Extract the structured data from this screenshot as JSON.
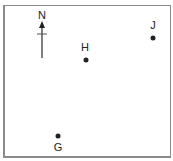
{
  "diagram": {
    "compass": {
      "label": "N",
      "icon": "north-arrow-icon"
    },
    "points": [
      {
        "label": "H",
        "x": 86,
        "y": 60,
        "label_x": 85,
        "label_y": 42
      },
      {
        "label": "J",
        "x": 153,
        "y": 38,
        "label_x": 153,
        "label_y": 20
      },
      {
        "label": "G",
        "x": 58,
        "y": 136,
        "label_x": 58,
        "label_y": 142
      }
    ]
  }
}
